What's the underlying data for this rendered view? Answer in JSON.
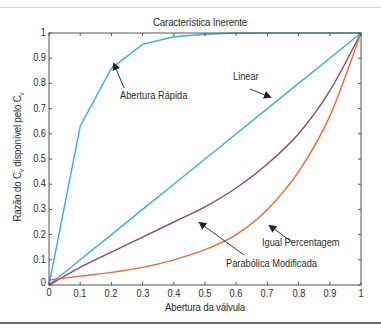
{
  "chart_data": {
    "type": "line",
    "title": "Característica Inerente",
    "xlabel": "Abertura da válvula",
    "ylabel": "Razão do Cv disponível pelo Cv",
    "ylabel_parts": {
      "pre": "Razão do C",
      "sub1": "v",
      "mid": " disponível pelo C",
      "sub2": "v"
    },
    "xlim": [
      0,
      1
    ],
    "ylim": [
      0,
      1
    ],
    "grid": false,
    "x_ticks": [
      "0",
      "0.1",
      "0.2",
      "0.3",
      "0.4",
      "0.5",
      "0.6",
      "0.7",
      "0.8",
      "0.9",
      "1"
    ],
    "y_ticks": [
      "0",
      "0.1",
      "0.2",
      "0.3",
      "0.4",
      "0.5",
      "0.6",
      "0.7",
      "0.8",
      "0.9",
      "1"
    ],
    "x": [
      0,
      0.1,
      0.2,
      0.3,
      0.4,
      0.5,
      0.6,
      0.7,
      0.8,
      0.9,
      1.0
    ],
    "series": [
      {
        "name": "Abertura Rápida",
        "color": "#3aaed8",
        "values": [
          0,
          0.63,
          0.86,
          0.955,
          0.985,
          0.995,
          1.0,
          1.0,
          1.0,
          1.0,
          1.0
        ]
      },
      {
        "name": "Linear",
        "color": "#3aaed8",
        "values": [
          0,
          0.1,
          0.2,
          0.3,
          0.4,
          0.5,
          0.6,
          0.7,
          0.8,
          0.9,
          1.0
        ]
      },
      {
        "name": "Parabólica Modificada",
        "color": "#8b4a6b",
        "values": [
          0,
          0.07,
          0.13,
          0.19,
          0.25,
          0.31,
          0.385,
          0.48,
          0.6,
          0.77,
          1.0
        ]
      },
      {
        "name": "Igual Percentagem",
        "color": "#f06a35",
        "values": [
          0.02,
          0.035,
          0.05,
          0.07,
          0.1,
          0.14,
          0.2,
          0.3,
          0.45,
          0.67,
          1.0
        ]
      }
    ],
    "annotations": [
      {
        "text": "Abertura Rápida",
        "target_series": "Abertura Rápida"
      },
      {
        "text": "Linear",
        "target_series": "Linear"
      },
      {
        "text": "Igual Percentagem",
        "target_series": "Igual Percentagem"
      },
      {
        "text": "Parabólica Modificada",
        "target_series": "Parabólica Modificada"
      }
    ],
    "legend": "none (inline annotations with arrows)"
  }
}
